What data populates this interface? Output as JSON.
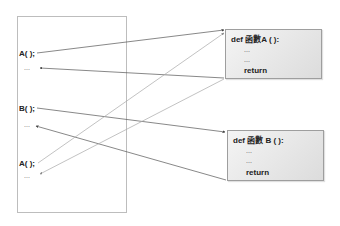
{
  "caller": {
    "lines": [
      {
        "id": "call-a-1",
        "text": "A( );"
      },
      {
        "id": "after-a-1",
        "text": "..."
      },
      {
        "id": "call-b",
        "text": "B( );"
      },
      {
        "id": "after-b",
        "text": "..."
      },
      {
        "id": "call-a-2",
        "text": "A( );"
      },
      {
        "id": "after-a-2",
        "text": "..."
      }
    ]
  },
  "functions": [
    {
      "id": "func-a",
      "signature": "def 函數A ( ):",
      "body": [
        "...",
        "..."
      ],
      "return_label": "return"
    },
    {
      "id": "func-b",
      "signature": "def 函數 B ( ):",
      "body": [
        "...",
        "..."
      ],
      "return_label": "return"
    }
  ],
  "links": [
    {
      "from": "A( ); (1st)",
      "to": "函數A",
      "type": "call"
    },
    {
      "from": "函數A return",
      "to": "... after 1st A( );",
      "type": "return"
    },
    {
      "from": "B( );",
      "to": "函數 B",
      "type": "call"
    },
    {
      "from": "函數 B return",
      "to": "... after B( );",
      "type": "return"
    },
    {
      "from": "A( ); (2nd)",
      "to": "函數A",
      "type": "call"
    },
    {
      "from": "函數A return",
      "to": "... after 2nd A( );",
      "type": "return"
    }
  ],
  "colors": {
    "line_dark": "#555555",
    "line_light": "#a8a8a8",
    "box_border": "#9e9e9e"
  }
}
